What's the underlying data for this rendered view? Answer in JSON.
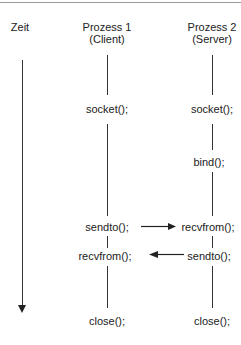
{
  "diagram": {
    "time_label": "Zeit",
    "process1": {
      "title": "Prozess 1",
      "role": "(Client)"
    },
    "process2": {
      "title": "Prozess 2",
      "role": "(Server)"
    },
    "client_calls": [
      "socket();",
      "sendto();",
      "recvfrom();",
      "close();"
    ],
    "server_calls": [
      "socket();",
      "bind();",
      "recvfrom();",
      "sendto();",
      "close();"
    ],
    "messages": [
      {
        "from": "client sendto()",
        "to": "server recvfrom()",
        "direction": "right"
      },
      {
        "from": "server sendto()",
        "to": "client recvfrom()",
        "direction": "left"
      }
    ]
  }
}
